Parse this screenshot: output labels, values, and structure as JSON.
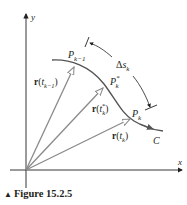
{
  "figure": {
    "caption_marker": "▲",
    "caption": "Figure 15.2.5",
    "axes": {
      "x_label": "x",
      "y_label": "y"
    },
    "curve": {
      "name": "C",
      "color": "#555555"
    },
    "points": {
      "p_prev": {
        "base": "P",
        "sub": "k−1"
      },
      "p_star": {
        "base": "P",
        "sup": "*",
        "sub": "k"
      },
      "p_k": {
        "base": "P",
        "sub": "k"
      }
    },
    "vectors": {
      "v_prev": {
        "bold": "r",
        "open": "(",
        "var": "t",
        "sub": "k−1",
        "close": ")"
      },
      "v_star": {
        "bold": "r",
        "open": "(",
        "var": "t",
        "sup": "*",
        "sub": "k",
        "close": ")"
      },
      "v_k": {
        "bold": "r",
        "open": "(",
        "var": "t",
        "sub": "k",
        "close": ")"
      },
      "color": "#8a8a8a"
    },
    "arc_length": {
      "delta": "Δ",
      "var": "s",
      "sub": "k"
    }
  }
}
